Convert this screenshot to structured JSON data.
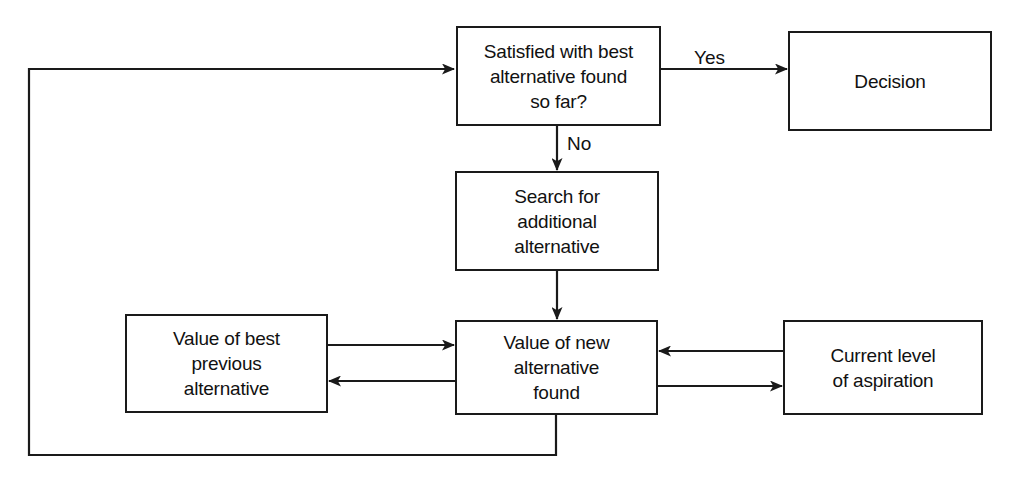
{
  "diagram": {
    "type": "flowchart",
    "background_color": "#ffffff",
    "line_color": "#1a1a1a",
    "text_color": "#111111",
    "nodes": [
      {
        "id": "satisfied",
        "label": "Satisfied with best\nalternative found\nso far?",
        "x": 456,
        "y": 26,
        "w": 205,
        "h": 100
      },
      {
        "id": "decision",
        "label": "Decision",
        "x": 788,
        "y": 31,
        "w": 204,
        "h": 100
      },
      {
        "id": "search",
        "label": "Search for\nadditional\nalternative",
        "x": 455,
        "y": 171,
        "w": 204,
        "h": 100
      },
      {
        "id": "value-best-previous",
        "label": "Value of best\nprevious\nalternative",
        "x": 125,
        "y": 314,
        "w": 203,
        "h": 99
      },
      {
        "id": "value-new",
        "label": "Value of new\nalternative\nfound",
        "x": 455,
        "y": 320,
        "w": 203,
        "h": 95
      },
      {
        "id": "current-aspiration",
        "label": "Current level\nof aspiration",
        "x": 783,
        "y": 320,
        "w": 200,
        "h": 95
      }
    ],
    "edge_labels": [
      {
        "id": "yes-label",
        "text": "Yes",
        "x": 694,
        "y": 47
      },
      {
        "id": "no-label",
        "text": "No",
        "x": 567,
        "y": 133
      }
    ],
    "edges": [
      {
        "id": "satisfied-to-decision",
        "from": "satisfied",
        "to": "decision",
        "label": "Yes"
      },
      {
        "id": "satisfied-to-search",
        "from": "satisfied",
        "to": "search",
        "label": "No"
      },
      {
        "id": "search-to-value-new",
        "from": "search",
        "to": "value-new",
        "label": ""
      },
      {
        "id": "best-previous-to-value-new",
        "from": "value-best-previous",
        "to": "value-new",
        "label": ""
      },
      {
        "id": "value-new-to-best-previous",
        "from": "value-new",
        "to": "value-best-previous",
        "label": ""
      },
      {
        "id": "aspiration-to-value-new",
        "from": "current-aspiration",
        "to": "value-new",
        "label": ""
      },
      {
        "id": "value-new-to-aspiration",
        "from": "value-new",
        "to": "current-aspiration",
        "label": ""
      },
      {
        "id": "value-new-feedback-to-satisfied",
        "from": "value-new",
        "to": "satisfied",
        "label": ""
      }
    ]
  }
}
